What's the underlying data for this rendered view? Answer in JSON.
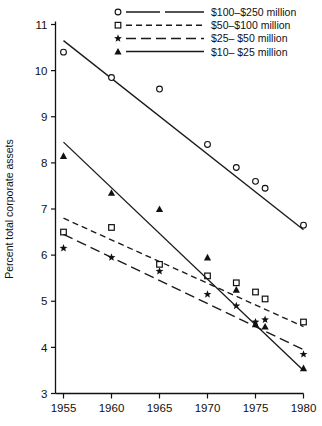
{
  "chart_data": {
    "type": "line",
    "title": "",
    "subtitle": "",
    "xlabel": "",
    "ylabel": "Percent total corporate assets",
    "xlim": [
      1953.5,
      1981.0
    ],
    "ylim": [
      3,
      11
    ],
    "xticks": [
      1955,
      1960,
      1965,
      1970,
      1975,
      1980
    ],
    "xtick_labels": [
      "1955",
      "1960",
      "1965",
      "1970",
      "1975",
      "1980"
    ],
    "yticks": [
      3,
      4,
      5,
      6,
      7,
      8,
      9,
      10,
      11
    ],
    "ytick_labels": [
      "3",
      "4",
      "5",
      "6",
      "7",
      "8",
      "9",
      "10",
      "11"
    ],
    "grid": false,
    "legend_position": "top-center",
    "series": [
      {
        "name": "$100-$250 million",
        "legend_label": "$100–$250 million",
        "marker": "open-circle",
        "line_style": "solid",
        "x": [
          1955,
          1960,
          1965,
          1970,
          1973,
          1975,
          1976,
          1980
        ],
        "y": [
          10.4,
          9.85,
          9.6,
          8.4,
          7.9,
          7.6,
          7.45,
          6.65
        ],
        "fit_line": {
          "x": [
            1955,
            1980
          ],
          "y": [
            10.65,
            6.55
          ]
        }
      },
      {
        "name": "$50-$100 million",
        "legend_label": "$50–$100 million",
        "marker": "open-square",
        "line_style": "dashed",
        "x": [
          1955,
          1960,
          1965,
          1970,
          1973,
          1975,
          1976,
          1980
        ],
        "y": [
          6.5,
          6.6,
          5.8,
          5.55,
          5.4,
          5.2,
          5.05,
          4.55
        ],
        "fit_line": {
          "x": [
            1955,
            1980
          ],
          "y": [
            6.8,
            4.45
          ]
        }
      },
      {
        "name": "$25-$50 million",
        "legend_label": "$25–  $50 million",
        "marker": "star",
        "line_style": "long-dash",
        "x": [
          1955,
          1960,
          1965,
          1970,
          1973,
          1975,
          1976,
          1980
        ],
        "y": [
          6.15,
          5.95,
          5.65,
          5.15,
          4.9,
          4.55,
          4.6,
          3.85
        ],
        "fit_line": {
          "x": [
            1955,
            1980
          ],
          "y": [
            6.45,
            3.95
          ]
        }
      },
      {
        "name": "$10-$25 million",
        "legend_label": "$10–  $25 million",
        "marker": "filled-triangle",
        "line_style": "solid",
        "x": [
          1955,
          1960,
          1965,
          1970,
          1973,
          1975,
          1976,
          1980
        ],
        "y": [
          8.15,
          7.35,
          7.0,
          5.95,
          5.25,
          4.5,
          4.45,
          3.55
        ],
        "fit_line": {
          "x": [
            1955,
            1980
          ],
          "y": [
            8.45,
            3.5
          ]
        }
      }
    ],
    "colors": {
      "axis": "#111111",
      "line": "#1a1a1a",
      "marker": "#111111",
      "background": "#ffffff"
    }
  }
}
